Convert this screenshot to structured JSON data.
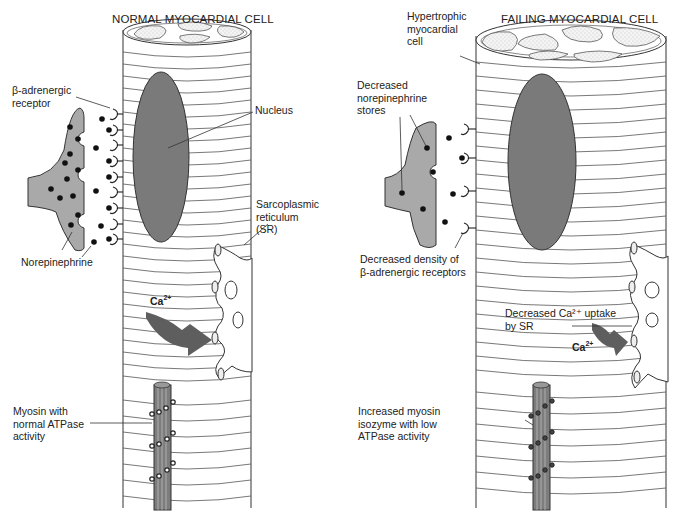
{
  "panels": {
    "normal": {
      "title": "NORMAL MYOCARDIAL CELL",
      "labels": {
        "receptor": "β-adrenergic\nreceptor",
        "nucleus": "Nucleus",
        "norepinephrine": "Norepinephrine",
        "sr": "Sarcoplasmic\nreticulum\n(SR)",
        "ca": "Ca",
        "ca_charge": "2+",
        "myosin": "Myosin with\nnormal ATPase\nactivity"
      }
    },
    "failing": {
      "title": "FAILING MYOCARDIAL CELL",
      "labels": {
        "hypertrophic": "Hypertrophic\nmyocardial\ncell",
        "ne_stores": "Decreased\nnorepinephrine\nstores",
        "receptor_density": "Decreased density of\nβ-adrenergic receptors",
        "ca_uptake": "Decreased Ca²⁺ uptake\nby SR",
        "ca": "Ca",
        "ca_charge": "2+",
        "myosin": "Increased myosin\nisozyme with low\nATPase activity"
      }
    }
  },
  "colors": {
    "nucleus": "#7a7a7a",
    "nerve_terminal": "#a9a9a9",
    "arrow": "#5e5e5e",
    "outline": "#333333",
    "background": "#ffffff"
  }
}
